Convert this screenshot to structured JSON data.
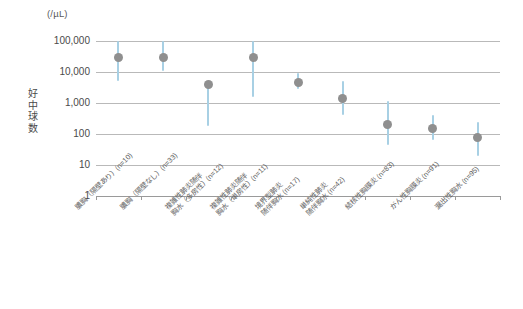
{
  "chart_data": {
    "type": "scatter",
    "title": "",
    "subtitle": "",
    "unit_label": "(/µL)",
    "ylabel": "好中球数",
    "xlabel": "",
    "yscale": "log",
    "ylim": [
      1,
      100000
    ],
    "grid": true,
    "legend": "none",
    "ytick_labels": [
      "100,000",
      "10,000",
      "1,000",
      "100",
      "10",
      "1"
    ],
    "ytick_values": [
      100000,
      10000,
      1000,
      100,
      10,
      1
    ],
    "categories": [
      "膿胸（隔壁あり）(n=10)",
      "膿胸（隔壁なし）(n=33)",
      "複雑性肺炎随伴胸水（多房性）(n=12)",
      "複雑性肺炎随伴胸水（単房性）(n=11)",
      "境界型肺炎随伴胸水 (n=17)",
      "単純性肺炎随伴胸水 (n=42)",
      "結核性胸膜炎 (n=83)",
      "がん性胸膜炎 (n=91)",
      "漏出性胸水 (n=95)"
    ],
    "category_lines": [
      [
        "膿胸（隔壁あり）(n=10)",
        ""
      ],
      [
        "膿胸（隔壁なし）(n=33)",
        ""
      ],
      [
        "複雑性肺炎随伴",
        "胸水（多房性）(n=12)"
      ],
      [
        "複雑性肺炎随伴",
        "胸水（単房性）(n=11)"
      ],
      [
        "境界型肺炎",
        "随伴胸水 (n=17)"
      ],
      [
        "単純性肺炎",
        "随伴胸水 (n=42)"
      ],
      [
        "結核性胸膜炎 (n=83)",
        ""
      ],
      [
        "がん性胸膜炎 (n=91)",
        ""
      ],
      [
        "漏出性胸水 (n=95)",
        ""
      ]
    ],
    "sample_sizes": [
      10,
      33,
      12,
      11,
      17,
      42,
      83,
      91,
      95
    ],
    "points": [
      {
        "category": "膿胸（隔壁あり）(n=10)",
        "value": 30000,
        "low": 5000,
        "high": 100000
      },
      {
        "category": "膿胸（隔壁なし）(n=33)",
        "value": 30000,
        "low": 11000,
        "high": 100000
      },
      {
        "category": "複雑性肺炎随伴胸水（多房性）(n=12)",
        "value": 4000,
        "low": 180,
        "high": 4000
      },
      {
        "category": "複雑性肺炎随伴胸水（単房性）(n=11)",
        "value": 29000,
        "low": 1600,
        "high": 100000
      },
      {
        "category": "境界型肺炎随伴胸水 (n=17)",
        "value": 4700,
        "low": 2900,
        "high": 9000
      },
      {
        "category": "単純性肺炎随伴胸水 (n=42)",
        "value": 1400,
        "low": 420,
        "high": 5000
      },
      {
        "category": "結核性胸膜炎 (n=83)",
        "value": 200,
        "low": 45,
        "high": 1200
      },
      {
        "category": "がん性胸膜炎 (n=91)",
        "value": 155,
        "low": 65,
        "high": 420
      },
      {
        "category": "漏出性胸水 (n=95)",
        "value": 78,
        "low": 20,
        "high": 250
      }
    ],
    "marker_color": "#8f8f8f",
    "errorbar_color": "#a8d0e4",
    "gridline_color": "#b9b9b9",
    "background_color": "#ffffff"
  }
}
